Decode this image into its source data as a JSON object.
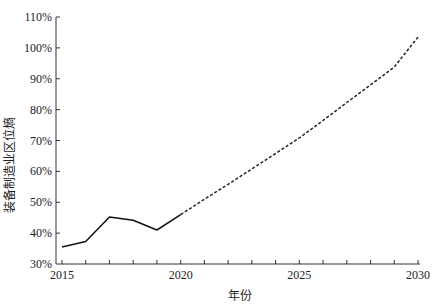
{
  "chart_data": {
    "type": "line",
    "title": "",
    "xlabel": "年份",
    "ylabel": "装备制造业区位熵",
    "x_ticks": [
      "2015",
      "2020",
      "2025",
      "2030"
    ],
    "y_ticks": [
      "30%",
      "40%",
      "50%",
      "60%",
      "70%",
      "80%",
      "90%",
      "100%",
      "110%"
    ],
    "xlim": [
      2015,
      2030
    ],
    "ylim": [
      30,
      110
    ],
    "grid": false,
    "legend": null,
    "series": [
      {
        "name": "actual",
        "style": "solid",
        "x": [
          2015,
          2016,
          2017,
          2018,
          2019,
          2020
        ],
        "values": [
          35.5,
          37.3,
          45.2,
          44.2,
          41.0,
          46.0
        ]
      },
      {
        "name": "projection",
        "style": "dashed",
        "x": [
          2020,
          2021,
          2022,
          2023,
          2024,
          2025,
          2026,
          2027,
          2028,
          2029,
          2030
        ],
        "values": [
          46.0,
          51.0,
          55.8,
          60.8,
          65.8,
          70.8,
          76.5,
          82.3,
          88.0,
          93.8,
          103.5
        ]
      }
    ]
  }
}
